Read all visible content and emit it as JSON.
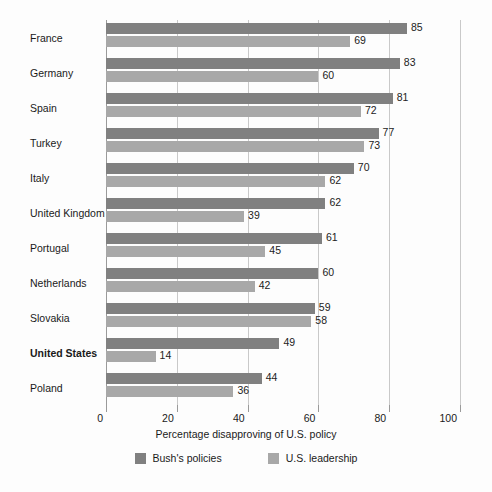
{
  "chart_data": {
    "type": "bar",
    "orientation": "horizontal",
    "title": "",
    "xlabel": "Percentage disapproving of U.S. policy",
    "ylabel": "",
    "xlim": [
      0,
      100
    ],
    "xticks": [
      0,
      20,
      40,
      60,
      80,
      100
    ],
    "grid": true,
    "legend_position": "bottom-center",
    "categories": [
      "France",
      "Germany",
      "Spain",
      "Turkey",
      "Italy",
      "United Kingdom",
      "Portugal",
      "Netherlands",
      "Slovakia",
      "United States",
      "Poland"
    ],
    "emphasized_categories": [
      "United States"
    ],
    "series": [
      {
        "name": "Bush's policies",
        "color": "#808080",
        "values": [
          85,
          83,
          81,
          77,
          70,
          62,
          61,
          60,
          59,
          49,
          44
        ]
      },
      {
        "name": "U.S. leadership",
        "color": "#a8a8a8",
        "values": [
          69,
          60,
          72,
          73,
          62,
          39,
          45,
          42,
          58,
          14,
          36
        ]
      }
    ]
  },
  "axis": {
    "tick_labels": [
      "0",
      "20",
      "40",
      "60",
      "80",
      "100"
    ]
  },
  "colors": {
    "series_bush": "#808080",
    "series_leadership": "#a8a8a8",
    "gridline": "#c9c9c9",
    "axis": "#9a9a9a",
    "text": "#1a1a1a",
    "background": "#fdfdfd"
  }
}
